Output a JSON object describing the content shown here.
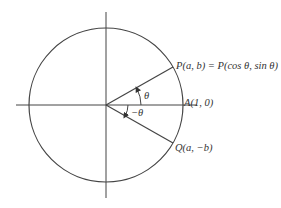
{
  "diagram": {
    "type": "unit-circle",
    "center": [
      106,
      105
    ],
    "radius": 76,
    "angle_deg": 30,
    "colors": {
      "stroke": "#333333",
      "background": "#ffffff"
    },
    "labels": {
      "P": "P(a, b) = P(cos θ, sin θ)",
      "A": "A(1, 0)",
      "Q": "Q(a, −b)",
      "theta": "θ",
      "neg_theta": "−θ"
    }
  }
}
